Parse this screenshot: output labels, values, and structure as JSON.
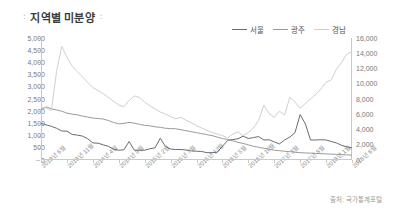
{
  "header": {
    "title": "지역별 미분양",
    "mark_left": "∶",
    "mark_right": "∶"
  },
  "footer": {
    "source": "출처: 국가통계포털"
  },
  "chart_data": {
    "type": "line",
    "title": "지역별 미분양",
    "xlabel": "",
    "ylabel": "",
    "grid": false,
    "legend_position": "top-right",
    "colors": {
      "seoul": "#6b6b6b",
      "gwangju": "#9a9a9a",
      "gyeongnam": "#cfcfcf",
      "axis": "#c9c9c9",
      "text": "#777777"
    },
    "left_axis": {
      "label": "",
      "ylim": [
        0,
        5000
      ],
      "ticks": [
        "0",
        "500",
        "1,000",
        "1,500",
        "2,000",
        "2,500",
        "3,000",
        "3,500",
        "4,000",
        "4,500",
        "5,000"
      ],
      "tick_values": [
        0,
        500,
        1000,
        1500,
        2000,
        2500,
        3000,
        3500,
        4000,
        4500,
        5000
      ]
    },
    "right_axis": {
      "label": "",
      "ylim": [
        0,
        16000
      ],
      "ticks": [
        "0",
        "2,000",
        "4,000",
        "6,000",
        "8,000",
        "10,000",
        "12,000",
        "14,000",
        "16,000"
      ],
      "tick_values": [
        0,
        2000,
        4000,
        6000,
        8000,
        10000,
        12000,
        14000,
        16000
      ]
    },
    "x_tick_labels": [
      "2013년 6월",
      "2013년 11월",
      "2014년 4월",
      "2014년 9월",
      "2015년 2월",
      "2015년 7월",
      "2015년 12월",
      "2016년 5월",
      "2016년 10월",
      "2017년 3월",
      "2017년 8월",
      "2018년 1월",
      "2018년 6월"
    ],
    "x_tick_indices": [
      0,
      5,
      10,
      15,
      20,
      25,
      30,
      35,
      40,
      45,
      50,
      55,
      60
    ],
    "n_points": 61,
    "series": [
      {
        "name": "서울",
        "axis": "left",
        "values": [
          1500,
          1440,
          1380,
          1300,
          1190,
          1180,
          1050,
          1020,
          980,
          870,
          700,
          690,
          620,
          560,
          440,
          400,
          420,
          760,
          400,
          400,
          400,
          460,
          500,
          890,
          560,
          450,
          430,
          430,
          410,
          370,
          360,
          350,
          300,
          300,
          320,
          560,
          800,
          840,
          870,
          980,
          880,
          920,
          960,
          820,
          830,
          740,
          660,
          820,
          940,
          1120,
          1860,
          1480,
          820,
          820,
          830,
          820,
          760,
          700,
          600,
          540,
          500
        ]
      },
      {
        "name": "광주",
        "axis": "left",
        "values": [
          2060,
          2180,
          2100,
          2050,
          2000,
          1920,
          1880,
          1850,
          1800,
          1760,
          1720,
          1700,
          1680,
          1620,
          1540,
          1480,
          1500,
          1540,
          1510,
          1460,
          1420,
          1400,
          1360,
          1340,
          1300,
          1290,
          1280,
          1240,
          1200,
          1160,
          1120,
          1080,
          1040,
          1000,
          940,
          880,
          840,
          790,
          720,
          680,
          620,
          560,
          520,
          480,
          440,
          400,
          380,
          360,
          340,
          320,
          300,
          290,
          280,
          270,
          260,
          250,
          240,
          230,
          220,
          210,
          200
        ]
      },
      {
        "name": "경남",
        "axis": "right",
        "values": [
          6900,
          6800,
          6500,
          11600,
          14900,
          13500,
          12300,
          11600,
          10900,
          10200,
          9500,
          9100,
          8700,
          8200,
          7700,
          7200,
          7000,
          7800,
          8400,
          8200,
          7600,
          7100,
          6700,
          6300,
          6000,
          5700,
          5400,
          5600,
          5200,
          4900,
          4500,
          4200,
          3900,
          3600,
          3400,
          3200,
          2900,
          3400,
          3700,
          3200,
          3600,
          4200,
          5200,
          7200,
          6100,
          5600,
          6400,
          5900,
          8200,
          7600,
          6800,
          7400,
          8000,
          8600,
          9300,
          10200,
          10500,
          11900,
          12800,
          13900,
          14200
        ]
      }
    ]
  }
}
